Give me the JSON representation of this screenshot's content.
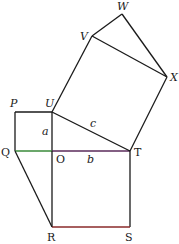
{
  "diagram": {
    "type": "geometry",
    "colors": {
      "line": "#1a1a1a",
      "green_segment": "#3a8a3a",
      "purple_segment": "#5a2a5a",
      "red_segment": "#8a2a2a",
      "background": "#ffffff"
    },
    "points": {
      "P": {
        "label": "P",
        "x": 15,
        "y": 112
      },
      "U": {
        "label": "U",
        "x": 52,
        "y": 112
      },
      "Q": {
        "label": "Q",
        "x": 15,
        "y": 151
      },
      "O": {
        "label": "O",
        "x": 52,
        "y": 151
      },
      "T": {
        "label": "T",
        "x": 130,
        "y": 151
      },
      "R": {
        "label": "R",
        "x": 52,
        "y": 227
      },
      "S": {
        "label": "S",
        "x": 130,
        "y": 227
      },
      "V": {
        "label": "V",
        "x": 92,
        "y": 36
      },
      "W": {
        "label": "W",
        "x": 122,
        "y": 14
      },
      "X": {
        "label": "X",
        "x": 167,
        "y": 77
      }
    },
    "side_labels": {
      "a": "a",
      "b": "b",
      "c": "c"
    },
    "segments": [
      [
        "P",
        "U"
      ],
      [
        "P",
        "Q"
      ],
      [
        "U",
        "O"
      ],
      [
        "O",
        "R"
      ],
      [
        "Q",
        "O"
      ],
      [
        "O",
        "T"
      ],
      [
        "U",
        "T"
      ],
      [
        "T",
        "S"
      ],
      [
        "R",
        "S"
      ],
      [
        "Q",
        "R"
      ],
      [
        "U",
        "V"
      ],
      [
        "V",
        "X"
      ],
      [
        "X",
        "T"
      ],
      [
        "V",
        "W"
      ],
      [
        "W",
        "X"
      ]
    ]
  }
}
